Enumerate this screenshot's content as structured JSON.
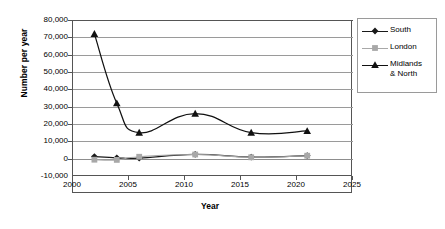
{
  "chart_data": {
    "type": "line",
    "title": "",
    "xlabel": "Year",
    "ylabel": "Number per year",
    "xlim": [
      2000,
      2025
    ],
    "ylim": [
      -10000,
      80000
    ],
    "grid": true,
    "legend_position": "right",
    "xticks": [
      "2000",
      "2005",
      "2010",
      "2015",
      "2020",
      "2025"
    ],
    "xtick_values": [
      2000,
      2005,
      2010,
      2015,
      2020,
      2025
    ],
    "yticks": [
      "80,000",
      "70,000",
      "60,000",
      "50,000",
      "40,000",
      "30,000",
      "20,000",
      "10,000",
      "0",
      "-10,000"
    ],
    "ytick_values": [
      80000,
      70000,
      60000,
      50000,
      40000,
      30000,
      20000,
      10000,
      0,
      -10000
    ],
    "x": [
      2002,
      2004,
      2006,
      2011,
      2016,
      2021
    ],
    "series": [
      {
        "name": "South",
        "marker": "diamond",
        "color": "#1a1a1a",
        "values": [
          1200,
          500,
          300,
          2500,
          900,
          1800
        ]
      },
      {
        "name": "London",
        "marker": "square",
        "color": "#a8a8a8",
        "values": [
          -600,
          -700,
          1100,
          2400,
          800,
          1700
        ]
      },
      {
        "name": "Midlands & North",
        "marker": "triangle",
        "color": "#111111",
        "values": [
          72000,
          32000,
          15000,
          26000,
          15000,
          16000
        ]
      }
    ]
  },
  "legend": {
    "items": [
      {
        "label": "South"
      },
      {
        "label": "London"
      },
      {
        "label": "Midlands\n& North"
      }
    ]
  }
}
